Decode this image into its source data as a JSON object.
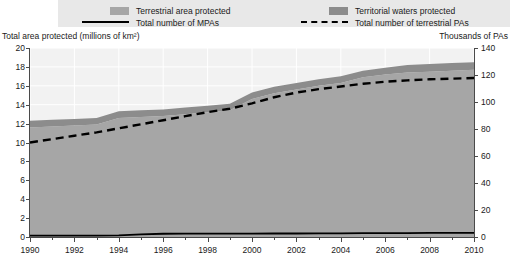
{
  "legend": {
    "items": [
      {
        "marker": "area-swatch",
        "label": "Terrestrial area protected",
        "color": "#a6a6a6"
      },
      {
        "marker": "area-swatch",
        "label": "Territorial waters protected",
        "color": "#8c8c8c"
      },
      {
        "marker": "solid-line",
        "label": "Total number of MPAs",
        "color": "#000000"
      },
      {
        "marker": "dashed-line",
        "label": "Total number of terrestrial PAs",
        "color": "#000000"
      }
    ],
    "background": "#e8e8e8"
  },
  "axes": {
    "left_title": "Total area protected (millions of km²)",
    "right_title": "Thousands of PAs",
    "left_ticks": [
      "20",
      "18",
      "16",
      "14",
      "12",
      "10",
      "8",
      "6",
      "4",
      "2",
      "0"
    ],
    "right_ticks": [
      "140",
      "120",
      "100",
      "80",
      "60",
      "40",
      "20",
      "0"
    ],
    "x_ticks": [
      "1990",
      "1992",
      "1994",
      "1996",
      "1998",
      "2000",
      "2002",
      "2004",
      "2006",
      "2008",
      "2010"
    ]
  },
  "chart_data": {
    "type": "area",
    "title": "",
    "xlabel": "",
    "ylabel": "Total area protected (millions of km²)",
    "y2label": "Thousands of PAs",
    "xlim": [
      1990,
      2010
    ],
    "ylim": [
      0,
      20
    ],
    "y2lim": [
      0,
      140
    ],
    "grid": true,
    "legend_position": "top",
    "x": [
      1990,
      1991,
      1992,
      1993,
      1994,
      1995,
      1996,
      1997,
      1998,
      1999,
      2000,
      2001,
      2002,
      2003,
      2004,
      2005,
      2006,
      2007,
      2008,
      2009,
      2010
    ],
    "series": [
      {
        "name": "Terrestrial area protected",
        "axis": "left",
        "type": "area-stacked",
        "color": "#a6a6a6",
        "values": [
          11.6,
          11.7,
          11.8,
          11.9,
          12.6,
          12.7,
          12.8,
          13.0,
          13.2,
          13.4,
          14.6,
          15.2,
          15.6,
          16.0,
          16.3,
          16.9,
          17.2,
          17.4,
          17.5,
          17.6,
          17.7
        ]
      },
      {
        "name": "Territorial waters protected",
        "axis": "left",
        "type": "area-stacked",
        "color": "#8c8c8c",
        "values": [
          0.7,
          0.7,
          0.7,
          0.7,
          0.7,
          0.7,
          0.7,
          0.7,
          0.7,
          0.7,
          0.7,
          0.7,
          0.7,
          0.7,
          0.7,
          0.7,
          0.7,
          0.8,
          0.8,
          0.8,
          0.8
        ]
      },
      {
        "name": "Total number of MPAs",
        "axis": "right",
        "type": "line",
        "color": "#000000",
        "style": "solid",
        "values": [
          1.0,
          1.0,
          1.0,
          1.0,
          1.2,
          2.0,
          2.4,
          2.5,
          2.5,
          2.5,
          2.5,
          2.6,
          2.6,
          2.7,
          2.7,
          2.8,
          2.9,
          2.9,
          3.0,
          3.0,
          3.1
        ]
      },
      {
        "name": "Total number of terrestrial PAs",
        "axis": "right",
        "type": "line",
        "color": "#000000",
        "style": "dashed",
        "values": [
          70.0,
          72.5,
          75.0,
          77.5,
          80.5,
          83.5,
          86.5,
          89.5,
          92.5,
          95.0,
          99.0,
          103.5,
          107.0,
          109.5,
          111.5,
          113.5,
          115.0,
          116.0,
          116.8,
          117.3,
          117.8
        ]
      }
    ]
  }
}
